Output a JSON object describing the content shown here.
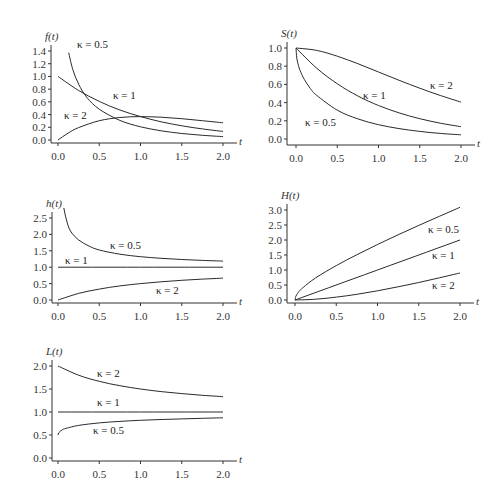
{
  "chart_data": [
    {
      "id": "f",
      "type": "line",
      "ylabel": "f(t)",
      "xlabel": "t",
      "xlim": [
        0,
        2
      ],
      "ylim": [
        0,
        1.4
      ],
      "xticks": [
        "0.0",
        "0.5",
        "1.0",
        "1.5",
        "2.0"
      ],
      "yticks": [
        "0.0",
        "0.2",
        "0.4",
        "0.6",
        "0.8",
        "1.0",
        "1.2",
        "1.4"
      ],
      "ytick_values": [
        0,
        0.2,
        0.4,
        0.6,
        0.8,
        1.0,
        1.2,
        1.4
      ],
      "frame": {
        "x0": 58,
        "x1": 223,
        "y0": 140,
        "y1": 51,
        "axis_x": 51,
        "axis_y": 143
      },
      "series": [
        {
          "name": "κ = 0.5",
          "x": [
            0.13,
            0.18,
            0.25,
            0.35,
            0.5,
            0.75,
            1.0,
            1.25,
            1.5,
            1.75,
            2.0
          ],
          "values": [
            1.374,
            1.107,
            0.879,
            0.668,
            0.484,
            0.308,
            0.208,
            0.145,
            0.103,
            0.074,
            0.054
          ],
          "label_pos": [
            77,
            48
          ]
        },
        {
          "name": "κ = 1",
          "x": [
            0,
            0.25,
            0.5,
            0.75,
            1.0,
            1.25,
            1.5,
            1.75,
            2.0
          ],
          "values": [
            1.0,
            0.779,
            0.607,
            0.472,
            0.368,
            0.287,
            0.223,
            0.174,
            0.135
          ],
          "label_pos": [
            113,
            99
          ]
        },
        {
          "name": "κ = 2",
          "x": [
            0,
            0.125,
            0.25,
            0.5,
            0.75,
            1.0,
            1.25,
            1.5,
            1.75,
            2.0
          ],
          "values": [
            0,
            0.11,
            0.195,
            0.303,
            0.354,
            0.368,
            0.358,
            0.335,
            0.304,
            0.271
          ],
          "label_pos": [
            64,
            119
          ]
        }
      ]
    },
    {
      "id": "S",
      "type": "line",
      "ylabel": "S(t)",
      "xlabel": "t",
      "xlim": [
        0,
        2
      ],
      "ylim": [
        0,
        1.0
      ],
      "xticks": [
        "0.0",
        "0.5",
        "1.0",
        "1.5",
        "2.0"
      ],
      "yticks": [
        "0.0",
        "0.2",
        "0.4",
        "0.6",
        "0.8",
        "1.0"
      ],
      "ytick_values": [
        0,
        0.2,
        0.4,
        0.6,
        0.8,
        1.0
      ],
      "frame": {
        "x0": 296,
        "x1": 461,
        "y0": 139,
        "y1": 48,
        "axis_x": 287,
        "axis_y": 145
      },
      "series": [
        {
          "name": "κ = 0.5",
          "x": [
            0,
            0.01,
            0.03,
            0.05,
            0.1,
            0.175,
            0.25,
            0.5,
            0.75,
            1.0,
            1.25,
            1.5,
            1.75,
            2.0
          ],
          "values": [
            1.0,
            0.888,
            0.807,
            0.752,
            0.655,
            0.554,
            0.48,
            0.317,
            0.221,
            0.157,
            0.114,
            0.083,
            0.061,
            0.046
          ],
          "label_pos": [
            305,
            126
          ]
        },
        {
          "name": "κ = 1",
          "x": [
            0,
            0.25,
            0.5,
            0.75,
            1.0,
            1.25,
            1.5,
            1.75,
            2.0
          ],
          "values": [
            1.0,
            0.779,
            0.607,
            0.472,
            0.368,
            0.287,
            0.223,
            0.174,
            0.135
          ],
          "label_pos": [
            363,
            99
          ]
        },
        {
          "name": "κ = 2",
          "x": [
            0,
            0.25,
            0.5,
            0.75,
            1.0,
            1.25,
            1.5,
            1.75,
            2.0
          ],
          "values": [
            1.0,
            0.974,
            0.91,
            0.827,
            0.736,
            0.645,
            0.558,
            0.478,
            0.406
          ],
          "label_pos": [
            430,
            89
          ]
        }
      ]
    },
    {
      "id": "h",
      "type": "line",
      "ylabel": "h(t)",
      "xlabel": "t",
      "xlim": [
        0,
        2
      ],
      "ylim": [
        0,
        2.5
      ],
      "xticks": [
        "0.0",
        "0.5",
        "1.0",
        "1.5",
        "2.0"
      ],
      "yticks": [
        "0.0",
        "0.5",
        "1.0",
        "1.5",
        "2.0",
        "2.5"
      ],
      "ytick_values": [
        0,
        0.5,
        1.0,
        1.5,
        2.0,
        2.5
      ],
      "frame": {
        "x0": 58,
        "x1": 223,
        "y0": 300,
        "y1": 218,
        "axis_x": 52,
        "axis_y": 303
      },
      "series": [
        {
          "name": "κ = 0.5",
          "x": [
            0.07,
            0.1,
            0.15,
            0.25,
            0.375,
            0.5,
            0.75,
            1.0,
            1.25,
            1.5,
            1.75,
            2.0
          ],
          "values": [
            2.807,
            2.464,
            2.108,
            1.833,
            1.647,
            1.525,
            1.396,
            1.32,
            1.271,
            1.234,
            1.207,
            1.187
          ],
          "label_pos": [
            110,
            249
          ]
        },
        {
          "name": "κ = 1",
          "x": [
            0,
            2.0
          ],
          "values": [
            1.0,
            1.0
          ],
          "label_pos": [
            65,
            264
          ]
        },
        {
          "name": "κ = 2",
          "x": [
            0,
            0.25,
            0.5,
            0.75,
            1.0,
            1.25,
            1.5,
            1.75,
            2.0
          ],
          "values": [
            0,
            0.2,
            0.333,
            0.429,
            0.5,
            0.556,
            0.6,
            0.636,
            0.667
          ],
          "label_pos": [
            156,
            294
          ]
        }
      ]
    },
    {
      "id": "H",
      "type": "line",
      "ylabel": "H(t)",
      "xlabel": "t",
      "xlim": [
        0,
        2
      ],
      "ylim": [
        0,
        3.0
      ],
      "xticks": [
        "0.0",
        "0.5",
        "1.0",
        "1.5",
        "2.0"
      ],
      "yticks": [
        "0.0",
        "0.5",
        "1.0",
        "1.5",
        "2.0",
        "2.5",
        "3.0"
      ],
      "ytick_values": [
        0,
        0.5,
        1.0,
        1.5,
        2.0,
        2.5,
        3.0
      ],
      "frame": {
        "x0": 295,
        "x1": 460,
        "y0": 300,
        "y1": 210,
        "axis_x": 287,
        "axis_y": 303
      },
      "series": [
        {
          "name": "κ = 0.5",
          "x": [
            0,
            0.01,
            0.03,
            0.05,
            0.1,
            0.25,
            0.5,
            0.75,
            1.0,
            1.25,
            1.5,
            1.75,
            2.0
          ],
          "values": [
            0,
            0.119,
            0.214,
            0.285,
            0.424,
            0.735,
            1.148,
            1.511,
            1.85,
            2.173,
            2.485,
            2.79,
            3.09
          ],
          "label_pos": [
            428,
            233
          ]
        },
        {
          "name": "κ = 1",
          "x": [
            0,
            2.0
          ],
          "values": [
            0,
            2.0
          ],
          "label_pos": [
            432,
            259
          ]
        },
        {
          "name": "κ = 2",
          "x": [
            0,
            0.25,
            0.5,
            0.75,
            1.0,
            1.25,
            1.5,
            1.75,
            2.0
          ],
          "values": [
            0,
            0.027,
            0.095,
            0.19,
            0.307,
            0.44,
            0.584,
            0.739,
            0.901
          ],
          "label_pos": [
            432,
            289
          ]
        }
      ]
    },
    {
      "id": "L",
      "type": "line",
      "ylabel": "L(t)",
      "xlabel": "t",
      "xlim": [
        0,
        2
      ],
      "ylim": [
        0,
        2.0
      ],
      "xticks": [
        "0.0",
        "0.5",
        "1.0",
        "1.5",
        "2.0"
      ],
      "yticks": [
        "0.0",
        "0.5",
        "1.0",
        "1.5",
        "2.0"
      ],
      "ytick_values": [
        0,
        0.5,
        1.0,
        1.5,
        2.0
      ],
      "frame": {
        "x0": 58,
        "x1": 223,
        "y0": 458,
        "y1": 366,
        "axis_x": 52,
        "axis_y": 461
      },
      "series": [
        {
          "name": "κ = 0.5",
          "x": [
            0,
            0.01,
            0.05,
            0.1,
            0.25,
            0.5,
            0.75,
            1.0,
            1.25,
            1.5,
            1.75,
            2.0
          ],
          "values": [
            0.5,
            0.55,
            0.61,
            0.645,
            0.708,
            0.763,
            0.796,
            0.82,
            0.838,
            0.851,
            0.863,
            0.873
          ],
          "label_pos": [
            93,
            434
          ]
        },
        {
          "name": "κ = 1",
          "x": [
            0,
            2.0
          ],
          "values": [
            1.0,
            1.0
          ],
          "label_pos": [
            97,
            406
          ]
        },
        {
          "name": "κ = 2",
          "x": [
            0,
            0.25,
            0.5,
            0.75,
            1.0,
            1.25,
            1.5,
            1.75,
            2.0
          ],
          "values": [
            2.0,
            1.8,
            1.667,
            1.571,
            1.5,
            1.444,
            1.4,
            1.364,
            1.333
          ],
          "label_pos": [
            97,
            377
          ]
        }
      ]
    }
  ]
}
